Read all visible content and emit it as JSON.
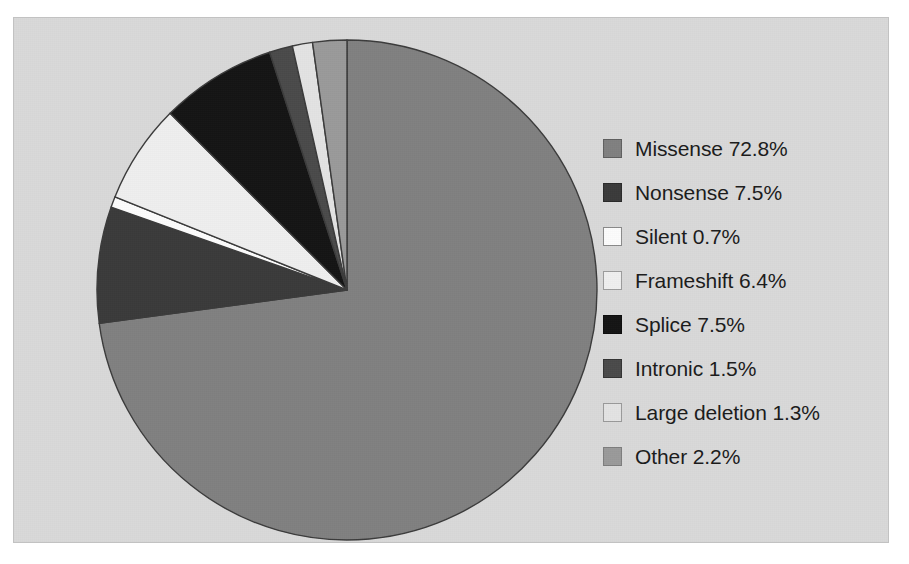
{
  "figure": {
    "background_color": "#d9d9d9",
    "page_color": "#ffffff",
    "border_color": "#c2c2c2"
  },
  "chart_data": {
    "type": "pie",
    "title": "",
    "subtitle": "",
    "xlabel": "",
    "ylabel": "",
    "grid": false,
    "legend_position": "right",
    "units": "%",
    "start_angle_deg": 0,
    "direction": "clockwise",
    "categories": [
      "Missense",
      "Nonsense",
      "Silent",
      "Frameshift",
      "Splice",
      "Intronic",
      "Large deletion",
      "Other"
    ],
    "values": [
      72.8,
      7.5,
      0.7,
      6.4,
      7.5,
      1.5,
      1.3,
      2.2
    ],
    "value_labels": [
      "72.8%",
      "7.5%",
      "0.7%",
      "6.4%",
      "7.5%",
      "1.5%",
      "1.3%",
      "2.2%"
    ],
    "colors": [
      "#808080",
      "#3a3a3a",
      "#fcfcfc",
      "#efefef",
      "#141414",
      "#4a4a4a",
      "#e3e3e3",
      "#9a9a9a"
    ],
    "slice_border_color": "#3b3b3b",
    "total": 100.0
  },
  "legend": {
    "items": [
      {
        "label": "Missense 72.8%",
        "name": "Missense",
        "value": 72.8,
        "color": "#808080",
        "border": "#5f5f5f"
      },
      {
        "label": "Nonsense 7.5%",
        "name": "Nonsense",
        "value": 7.5,
        "color": "#3a3a3a",
        "border": "#2a2a2a"
      },
      {
        "label": "Silent 0.7%",
        "name": "Silent",
        "value": 0.7,
        "color": "#fcfcfc",
        "border": "#8a8a8a"
      },
      {
        "label": "Frameshift 6.4%",
        "name": "Frameshift",
        "value": 6.4,
        "color": "#efefef",
        "border": "#9c9c9c"
      },
      {
        "label": "Splice 7.5%",
        "name": "Splice",
        "value": 7.5,
        "color": "#141414",
        "border": "#0d0d0d"
      },
      {
        "label": "Intronic 1.5%",
        "name": "Intronic",
        "value": 1.5,
        "color": "#4a4a4a",
        "border": "#333333"
      },
      {
        "label": "Large deletion 1.3%",
        "name": "Large deletion",
        "value": 1.3,
        "color": "#e3e3e3",
        "border": "#9a9a9a"
      },
      {
        "label": "Other 2.2%",
        "name": "Other",
        "value": 2.2,
        "color": "#9a9a9a",
        "border": "#7d7d7d"
      }
    ]
  }
}
